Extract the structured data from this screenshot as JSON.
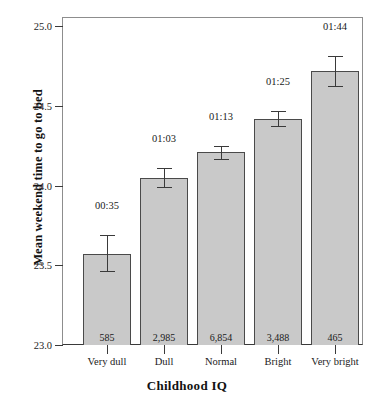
{
  "chart_data": {
    "type": "bar",
    "title": "",
    "xlabel": "Childhood IQ",
    "ylabel": "Mean weekend time to go to bed",
    "categories": [
      "Very dull",
      "Dull",
      "Normal",
      "Bright",
      "Very bright"
    ],
    "values": [
      23.57,
      24.05,
      24.21,
      24.42,
      24.72
    ],
    "value_labels": [
      "00:35",
      "01:03",
      "01:13",
      "01:25",
      "01:44"
    ],
    "counts": [
      "585",
      "2,985",
      "6,854",
      "3,488",
      "465"
    ],
    "error_low": [
      23.465,
      23.99,
      24.165,
      24.375,
      24.625
    ],
    "error_high": [
      23.69,
      24.11,
      24.25,
      24.465,
      24.815
    ],
    "ylim": [
      23.0,
      25.0
    ],
    "yticks": [
      "23.0",
      "23.5",
      "24.0",
      "24.5",
      "25.0"
    ],
    "ytick_values": [
      23.0,
      23.5,
      24.0,
      24.5,
      25.0
    ],
    "grid": false,
    "legend": "none",
    "bar_color": "#c9c9c9",
    "bar_edge_color": "#4a4a4a",
    "axis_color": "#3a3a3a",
    "text_color": "#1a1a1a"
  }
}
